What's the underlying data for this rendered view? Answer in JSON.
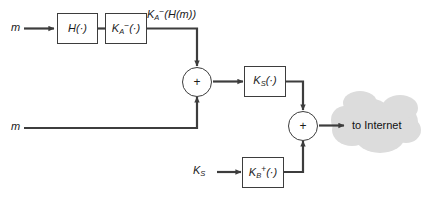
{
  "diagram": {
    "background_color": "#ffffff",
    "line_color": "#3d3d3d",
    "cloud_color": "#dcdcdc",
    "inputs": {
      "message_top": "m",
      "message_bottom": "m",
      "session_key": "K",
      "session_key_sub": "S"
    },
    "boxes": [
      {
        "id": "hash",
        "label_main": "H",
        "label_arg": "(·)"
      },
      {
        "id": "sign-private-a",
        "label_main": "K",
        "label_sub": "A",
        "label_sup": "−",
        "label_arg": "(·)"
      },
      {
        "id": "symmetric-ks",
        "label_main": "K",
        "label_sub": "S",
        "label_arg": "(·)"
      },
      {
        "id": "public-b",
        "label_main": "K",
        "label_sub": "B",
        "label_sup": "+",
        "label_arg": "(·)"
      }
    ],
    "signature_label": {
      "main": "K",
      "sub": "A",
      "sup": "−",
      "arg": "(H(m))"
    },
    "adders": [
      {
        "id": "adder-1",
        "symbol": "+"
      },
      {
        "id": "adder-2",
        "symbol": "+"
      }
    ],
    "output": {
      "cloud_label": "to Internet"
    }
  }
}
